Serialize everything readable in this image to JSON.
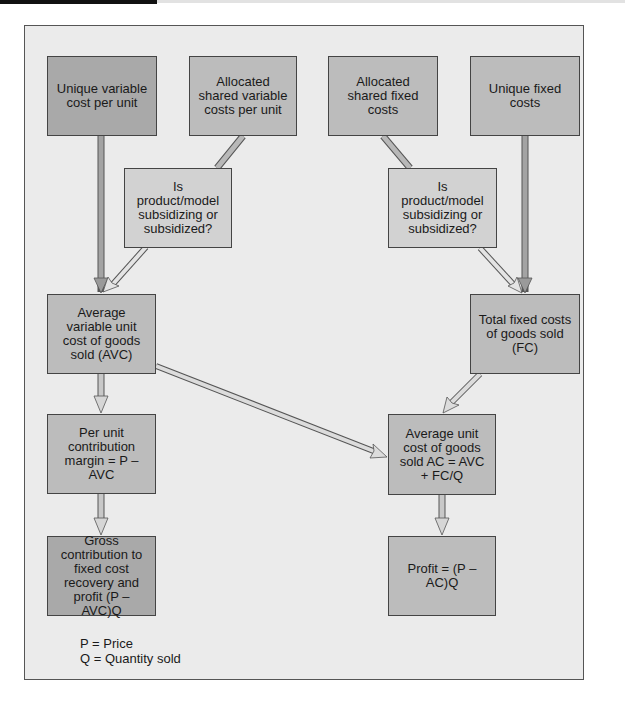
{
  "diagram": {
    "nodes": {
      "unique_variable": "Unique variable cost per unit",
      "allocated_shared_variable": "Allocated shared variable costs per unit",
      "allocated_shared_fixed": "Allocated shared fixed costs",
      "unique_fixed": "Unique fixed costs",
      "question_left": "Is product/model subsidizing or subsidized?",
      "question_right": "Is product/model subsidizing or subsidized?",
      "avc": "Average variable unit cost of goods sold (AVC)",
      "fc": "Total fixed costs of goods sold (FC)",
      "per_unit_margin": "Per unit contribution margin = P – AVC",
      "ac": "Average unit cost of goods sold AC = AVC + FC/Q",
      "gross_contribution": "Gross contribution to fixed cost recovery and profit (P – AVC)Q",
      "profit": "Profit = (P – AC)Q"
    },
    "edges": [
      {
        "from": "unique_variable",
        "to": "avc"
      },
      {
        "from": "allocated_shared_variable",
        "to": "question_left"
      },
      {
        "from": "question_left",
        "to": "avc"
      },
      {
        "from": "allocated_shared_fixed",
        "to": "question_right"
      },
      {
        "from": "question_right",
        "to": "fc"
      },
      {
        "from": "unique_fixed",
        "to": "fc"
      },
      {
        "from": "avc",
        "to": "per_unit_margin"
      },
      {
        "from": "avc",
        "to": "ac"
      },
      {
        "from": "fc",
        "to": "ac"
      },
      {
        "from": "per_unit_margin",
        "to": "gross_contribution"
      },
      {
        "from": "ac",
        "to": "profit"
      }
    ],
    "legend": {
      "p": "P = Price",
      "q": "Q = Quantity sold"
    }
  },
  "colors": {
    "background": "#ebebeb",
    "box_dark": "#a9a9a9",
    "box_mid": "#bcbcbc",
    "box_light": "#d2d2d2",
    "border": "#444444"
  }
}
